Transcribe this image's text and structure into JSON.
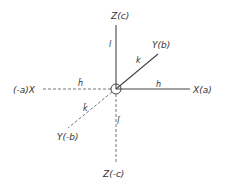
{
  "diagram": {
    "origin": {
      "x": 116,
      "y": 89,
      "radius": 5
    },
    "colors": {
      "line": "#444444",
      "text": "#333333",
      "background": "#ffffff"
    },
    "axes": {
      "z_pos": {
        "label": "Z(c)",
        "index": "l",
        "x1": 116,
        "y1": 89,
        "x2": 116,
        "y2": 25,
        "style": "solid"
      },
      "z_neg": {
        "label": "Z(-c)",
        "index": "l̄",
        "x1": 116,
        "y1": 89,
        "x2": 116,
        "y2": 163,
        "style": "dashed"
      },
      "x_pos": {
        "label": "X(a)",
        "index": "h",
        "x1": 116,
        "y1": 89,
        "x2": 190,
        "y2": 89,
        "style": "solid"
      },
      "x_neg": {
        "label": "(-a)X",
        "index": "h̄",
        "x1": 116,
        "y1": 89,
        "x2": 43,
        "y2": 89,
        "style": "dashed"
      },
      "y_pos": {
        "label": "Y(b)",
        "index": "k",
        "x1": 116,
        "y1": 89,
        "x2": 158,
        "y2": 54,
        "style": "solid"
      },
      "y_neg": {
        "label": "Y(-b)",
        "index": "k̄",
        "x1": 116,
        "y1": 89,
        "x2": 68,
        "y2": 128,
        "style": "dashed"
      }
    }
  }
}
